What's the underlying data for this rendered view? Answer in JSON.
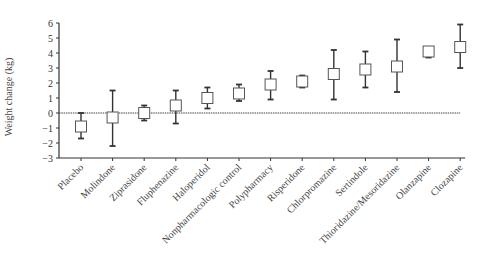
{
  "chart_data": {
    "type": "box",
    "title": "",
    "xlabel": "",
    "ylabel": "Weight change (kg)",
    "ylim": [
      -3,
      6
    ],
    "yticks": [
      6,
      5,
      4,
      3,
      2,
      1,
      0,
      -1,
      -2,
      -3
    ],
    "grid": false,
    "legend": null,
    "reference_line": 0,
    "categories": [
      "Placebo",
      "Molindone",
      "Ziprasidone",
      "Fluphenazine",
      "Haloperidol",
      "Nonpharmacologic control",
      "Polypharmacy",
      "Risperidone",
      "Chlorpromazine",
      "Sertindole",
      "Thioridazine/Mesoridazine",
      "Olanzapine",
      "Clozapine"
    ],
    "series": [
      {
        "name": "mean",
        "values": [
          -0.9,
          -0.3,
          0.0,
          0.5,
          1.0,
          1.3,
          1.9,
          2.1,
          2.6,
          2.9,
          3.1,
          4.1,
          4.4
        ]
      },
      {
        "name": "ci_upper",
        "values": [
          0.0,
          1.5,
          0.5,
          1.5,
          1.7,
          1.9,
          2.8,
          2.5,
          4.2,
          4.1,
          4.9,
          4.4,
          5.9
        ]
      },
      {
        "name": "ci_lower",
        "values": [
          -1.7,
          -2.2,
          -0.5,
          -0.7,
          0.3,
          0.8,
          0.9,
          1.7,
          0.9,
          1.7,
          1.4,
          3.7,
          3.0
        ]
      }
    ]
  }
}
